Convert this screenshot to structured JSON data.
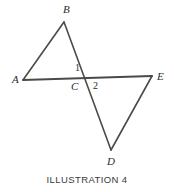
{
  "figure": {
    "caption": "ILLUSTRATION 4",
    "stroke_color": "#4a4a4a",
    "background_color": "#ffffff",
    "stroke_width": 1.6,
    "vertices": [
      {
        "id": "A",
        "label": "A",
        "x": 23,
        "y": 80,
        "label_x": 12,
        "label_y": 74
      },
      {
        "id": "B",
        "label": "B",
        "x": 64,
        "y": 22,
        "label_x": 63,
        "label_y": 4
      },
      {
        "id": "C",
        "label": "C",
        "x": 86,
        "y": 78,
        "label_x": 71,
        "label_y": 81
      },
      {
        "id": "D",
        "label": "D",
        "x": 111,
        "y": 150,
        "label_x": 107,
        "label_y": 156
      },
      {
        "id": "E",
        "label": "E",
        "x": 152,
        "y": 76,
        "label_x": 157,
        "label_y": 71
      }
    ],
    "angle_labels": [
      {
        "id": "1",
        "label": "1",
        "label_x": 75,
        "label_y": 63
      },
      {
        "id": "2",
        "label": "2",
        "label_x": 93,
        "label_y": 81
      }
    ],
    "segments": [
      {
        "id": "AB",
        "from": "A",
        "to": "B"
      },
      {
        "id": "BD",
        "from": "B",
        "to": "D"
      },
      {
        "id": "AE",
        "from": "A",
        "to": "E"
      },
      {
        "id": "DE",
        "from": "D",
        "to": "E"
      }
    ]
  }
}
